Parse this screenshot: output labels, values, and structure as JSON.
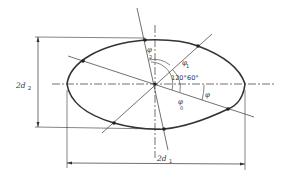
{
  "diagram": {
    "labels": {
      "phi2": "φ",
      "phi2_sub": "2",
      "phi1": "φ",
      "phi1_sub": "1",
      "phi0": "φ",
      "phi0_sub": "0",
      "phi": "φ",
      "angle120": "120°",
      "angle60": "60°",
      "dim_vertical": "2d",
      "dim_vertical_sub": "2",
      "dim_horizontal": "2d",
      "dim_horizontal_sub": "1"
    },
    "colors": {
      "stroke": "#333333",
      "background": "#ffffff"
    }
  }
}
